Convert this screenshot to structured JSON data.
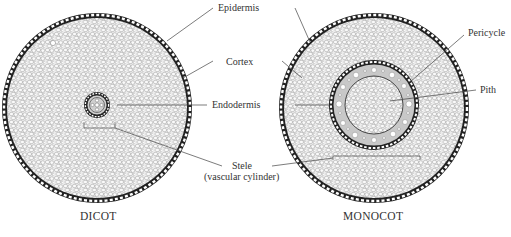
{
  "diagram": {
    "type": "root cross-section comparison",
    "panels": [
      {
        "id": "dicot",
        "title": "DICOT"
      },
      {
        "id": "monocot",
        "title": "MONOCOT"
      }
    ],
    "labels": {
      "epidermis": "Epidermis",
      "cortex": "Cortex",
      "endodermis": "Endodermis",
      "stele_line1": "Stele",
      "stele_line2": "(vascular cylinder)",
      "pericycle": "Pericycle",
      "pith": "Pith"
    },
    "colors": {
      "outline": "#222222",
      "tissue_fill": "#e9e9e9",
      "pericycle_band": "#c8c8c8",
      "label_text": "#333333",
      "leader_line": "#444444"
    }
  }
}
